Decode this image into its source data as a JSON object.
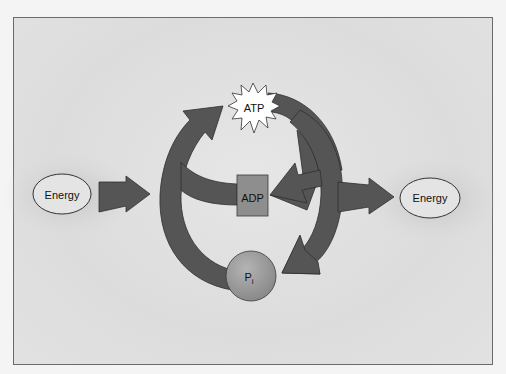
{
  "diagram": {
    "nodes": {
      "energy_in": {
        "label": "Energy"
      },
      "energy_out": {
        "label": "Energy"
      },
      "atp": {
        "label": "ATP"
      },
      "adp": {
        "label": "ADP"
      },
      "pi": {
        "label": "P",
        "subscript": "i"
      }
    },
    "edges": [
      {
        "from": "energy_in",
        "to": "cycle",
        "type": "input-arrow"
      },
      {
        "from": "adp",
        "to": "atp",
        "type": "curved-arrow"
      },
      {
        "from": "pi",
        "to": "atp",
        "type": "curved-arrow"
      },
      {
        "from": "atp",
        "to": "adp",
        "type": "curved-arrow"
      },
      {
        "from": "atp",
        "to": "pi",
        "type": "curved-arrow"
      },
      {
        "from": "cycle",
        "to": "energy_out",
        "type": "output-arrow"
      }
    ],
    "colors": {
      "arrow_fill": "#555555",
      "arrow_stroke": "#2e2e2e",
      "adp_fill": "#8e8e8e",
      "pi_fill": "#9a9a9a",
      "atp_fill": "#ffffff",
      "background": "#e0e0e0",
      "frame_border": "#6a6a6a"
    }
  }
}
